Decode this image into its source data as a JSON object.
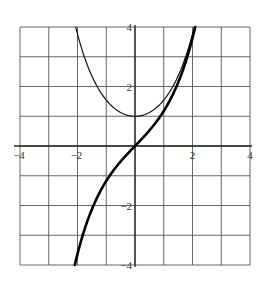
{
  "chart_data": {
    "type": "line",
    "title": "",
    "xlabel": "",
    "ylabel": "",
    "xlim": [
      -4,
      4
    ],
    "ylim": [
      -4,
      4
    ],
    "grid": true,
    "grid_step": 1,
    "x_tick_labels": [
      {
        "value": -4,
        "label": "-4"
      },
      {
        "value": -2,
        "label": "-2"
      },
      {
        "value": 2,
        "label": "2"
      },
      {
        "value": 4,
        "label": "4"
      }
    ],
    "y_tick_labels": [
      {
        "value": 4,
        "label": "4"
      },
      {
        "value": 2,
        "label": "2"
      },
      {
        "value": -2,
        "label": "-2"
      },
      {
        "value": -4,
        "label": "-4"
      }
    ],
    "series": [
      {
        "name": "cosh(x)",
        "style": "thin",
        "stroke_width": 1.2,
        "color": "#111111",
        "x": [
          -2.06,
          -1.5,
          -1,
          -0.5,
          0,
          0.5,
          1,
          1.5,
          2.06
        ],
        "values": [
          4.0,
          2.35,
          1.54,
          1.13,
          1.0,
          1.13,
          1.54,
          2.35,
          4.0
        ]
      },
      {
        "name": "sinh(x)",
        "style": "thick",
        "stroke_width": 2.6,
        "color": "#000000",
        "x": [
          -2.09,
          -1.5,
          -1,
          -0.5,
          0,
          0.5,
          1,
          1.5,
          2.09
        ],
        "values": [
          -4.0,
          -2.13,
          -1.18,
          -0.52,
          0,
          0.52,
          1.18,
          2.13,
          4.0
        ]
      }
    ]
  },
  "colors": {
    "grid": "#555555",
    "axis": "#222222",
    "background": "#ffffff"
  }
}
